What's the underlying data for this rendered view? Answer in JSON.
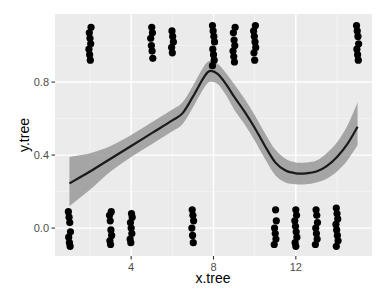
{
  "chart_data": {
    "type": "scatter",
    "title": "",
    "xlabel": "x.tree",
    "ylabel": "y.tree",
    "xlim": [
      0.3,
      15.7
    ],
    "ylim": [
      -0.153,
      1.173
    ],
    "x_ticks": [
      4,
      8,
      12
    ],
    "x_tick_labels": [
      "4",
      "8",
      "12"
    ],
    "x_minor_grid": [
      2,
      6,
      10,
      14
    ],
    "y_ticks": [
      0.0,
      0.4,
      0.8
    ],
    "y_tick_labels": [
      "0.0",
      "0.4",
      "0.8"
    ],
    "y_minor_grid": [
      0.2,
      0.6,
      1.0
    ],
    "grid": true,
    "legend": null,
    "series": [
      {
        "name": "points",
        "kind": "jittered-points",
        "color": "#000000",
        "groups": [
          {
            "x": 1,
            "y": 0,
            "values": [
              0.09,
              0.06,
              0.03,
              -0.02,
              -0.05,
              -0.08,
              -0.1
            ]
          },
          {
            "x": 2,
            "y": 1,
            "values": [
              1.1,
              1.07,
              1.04,
              1.01,
              0.98,
              0.95,
              0.92
            ]
          },
          {
            "x": 3,
            "y": 0,
            "values": [
              0.09,
              0.07,
              0.04,
              -0.01,
              -0.04,
              -0.07,
              -0.09
            ]
          },
          {
            "x": 4,
            "y": 0,
            "values": [
              0.08,
              0.06,
              0.03,
              0.0,
              -0.03,
              -0.06,
              -0.08
            ]
          },
          {
            "x": 5,
            "y": 1,
            "values": [
              1.1,
              1.07,
              1.04,
              1.0,
              0.97,
              0.93
            ]
          },
          {
            "x": 6,
            "y": 1,
            "values": [
              1.08,
              1.05,
              1.02,
              0.99,
              0.96
            ]
          },
          {
            "x": 7,
            "y": 0,
            "values": [
              0.1,
              0.07,
              0.04,
              0.0,
              -0.04,
              -0.08
            ]
          },
          {
            "x": 8,
            "y": 1,
            "values": [
              1.11,
              1.08,
              1.05,
              1.02,
              0.98,
              0.95,
              0.92,
              0.89
            ]
          },
          {
            "x": 9,
            "y": 1,
            "values": [
              1.1,
              1.07,
              1.03,
              1.0,
              0.97,
              0.94,
              0.91
            ]
          },
          {
            "x": 10,
            "y": 1,
            "values": [
              1.11,
              1.08,
              1.05,
              1.02,
              0.99,
              0.96,
              0.92
            ]
          },
          {
            "x": 11,
            "y": 0,
            "values": [
              0.1,
              0.04,
              0.0,
              -0.03,
              -0.06,
              -0.09
            ]
          },
          {
            "x": 12,
            "y": 0,
            "values": [
              0.1,
              0.07,
              0.04,
              0.01,
              -0.02,
              -0.05,
              -0.08,
              -0.1
            ]
          },
          {
            "x": 13,
            "y": 0,
            "values": [
              0.1,
              0.07,
              0.03,
              0.0,
              -0.03,
              -0.06,
              -0.09
            ]
          },
          {
            "x": 14,
            "y": 0,
            "values": [
              0.11,
              0.08,
              0.05,
              0.02,
              -0.01,
              -0.04,
              -0.07,
              -0.1
            ]
          },
          {
            "x": 15,
            "y": 1,
            "values": [
              1.11,
              1.08,
              1.05,
              1.01,
              0.98,
              0.95,
              0.92
            ]
          }
        ]
      },
      {
        "name": "smooth",
        "kind": "loess-line",
        "color": "#1a1a1a",
        "x": [
          1,
          2,
          3,
          4,
          5,
          6,
          6.5,
          7,
          7.5,
          7.8,
          8.2,
          8.6,
          9,
          9.5,
          10,
          10.5,
          11,
          11.5,
          12,
          12.5,
          13,
          13.5,
          14,
          14.5,
          15
        ],
        "y": [
          0.245,
          0.31,
          0.38,
          0.45,
          0.52,
          0.59,
          0.63,
          0.72,
          0.82,
          0.86,
          0.845,
          0.79,
          0.72,
          0.64,
          0.55,
          0.45,
          0.36,
          0.315,
          0.3,
          0.3,
          0.31,
          0.34,
          0.39,
          0.46,
          0.555
        ],
        "upper": [
          0.39,
          0.41,
          0.45,
          0.51,
          0.58,
          0.65,
          0.69,
          0.78,
          0.88,
          0.915,
          0.9,
          0.85,
          0.79,
          0.71,
          0.62,
          0.52,
          0.43,
          0.38,
          0.36,
          0.36,
          0.37,
          0.41,
          0.47,
          0.56,
          0.69
        ],
        "lower": [
          0.12,
          0.21,
          0.31,
          0.39,
          0.46,
          0.53,
          0.57,
          0.66,
          0.76,
          0.8,
          0.79,
          0.73,
          0.65,
          0.57,
          0.48,
          0.38,
          0.29,
          0.25,
          0.24,
          0.24,
          0.25,
          0.27,
          0.31,
          0.37,
          0.455
        ],
        "ribbon_color": "#999999"
      }
    ],
    "colors": {
      "panel_background": "#EBEBEB",
      "grid_major": "#FFFFFF",
      "grid_minor": "#F5F5F5",
      "tick_label": "#4D4D4D",
      "axis_title": "#000000"
    }
  },
  "axes": {
    "x_title": "x.tree",
    "y_title": "y.tree"
  }
}
